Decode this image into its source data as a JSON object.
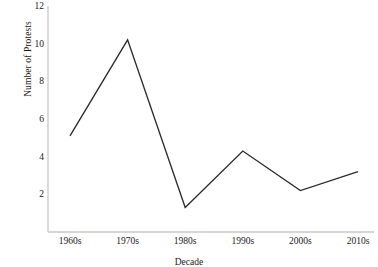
{
  "chart_data": {
    "type": "line",
    "title": "",
    "xlabel": "Decade",
    "ylabel": "Number of Protests",
    "categories": [
      "1960s",
      "1970s",
      "1980s",
      "1990s",
      "2000s",
      "2010s"
    ],
    "values": [
      5.1,
      10.2,
      1.3,
      4.3,
      2.2,
      3.2
    ],
    "series": [
      {
        "name": "Number of Protests",
        "values": [
          5.1,
          10.2,
          1.3,
          4.3,
          2.2,
          3.2
        ]
      }
    ],
    "ylim": [
      0,
      12
    ],
    "yticks": [
      2,
      4,
      6,
      8,
      10,
      12
    ],
    "ytick_labels": [
      "2",
      "4",
      "6",
      "8",
      "10",
      "12"
    ],
    "grid": false,
    "legend": false,
    "markers": false,
    "line_color": "#2b2b2b",
    "axis_color": "#c8c8c8",
    "background": "#ffffff"
  }
}
